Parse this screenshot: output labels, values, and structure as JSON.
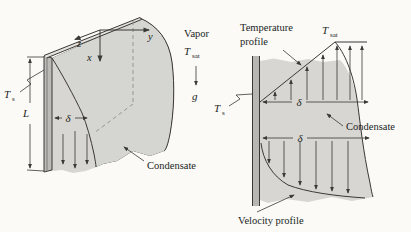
{
  "figure_title": "film-condensation-on-vertical-plate",
  "colors": {
    "background": "#fbfaf7",
    "ink": "#3a3936",
    "film_gray": "#d7d6d2",
    "vapor_body_gray": "#ececе8",
    "plate_gray": "#bcbbb7",
    "wall_gray": "#b7b6b2",
    "dash_gray": "#8f8e8a"
  },
  "left_figure": {
    "axes": {
      "x": "x",
      "y": "y",
      "z": "z"
    },
    "vapor": "Vapor",
    "t_sat": {
      "base": "T",
      "sub": "sat"
    },
    "gravity": "g",
    "t_s": {
      "base": "T",
      "sub": "s"
    },
    "plate_length": "L",
    "film_thickness": "δ",
    "condensate": "Condensate"
  },
  "right_figure": {
    "temperature_profile": {
      "line1": "Temperature",
      "line2": "profile"
    },
    "t_sat": {
      "base": "T",
      "sub": "sat"
    },
    "t_s": {
      "base": "T",
      "sub": "s"
    },
    "film_thickness_top": "δ",
    "film_thickness_bottom": "δ",
    "condensate": "Condensate",
    "velocity_profile": "Velocity profile"
  }
}
